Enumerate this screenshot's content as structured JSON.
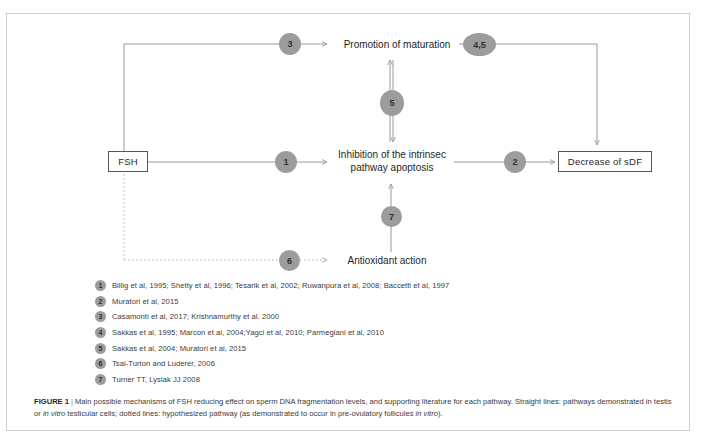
{
  "figure": {
    "caption_label": "FIGURE 1",
    "caption_separator": "|",
    "caption_part1": "Main possible mechanisms of FSH reducing effect on sperm DNA fragmentation levels, and supporting literature for each pathway. Straight lines: pathways demonstrated in testis or ",
    "caption_italic1": "in vitro",
    "caption_part2": " testicular cells; dotted lines: hypothesized pathway (as demonstrated to occur in pre-ovulatory follicules ",
    "caption_italic2": "in vitro",
    "caption_part3": ")."
  },
  "diagram": {
    "nodes": {
      "fsh": "FSH",
      "promotion": "Promotion of maturation",
      "inhibition_line1": "Inhibition of the intrinsec",
      "inhibition_line2": "pathway apoptosis",
      "antioxidant": "Antioxidant action",
      "decrease": "Decrease  of sDF"
    },
    "badges": [
      {
        "id": "badge-3",
        "label": "3"
      },
      {
        "id": "badge-45",
        "label": "4,5"
      },
      {
        "id": "badge-5",
        "label": "5"
      },
      {
        "id": "badge-1",
        "label": "1"
      },
      {
        "id": "badge-2",
        "label": "2"
      },
      {
        "id": "badge-7",
        "label": "7"
      },
      {
        "id": "badge-6",
        "label": "6"
      }
    ],
    "colors": {
      "badge_fill": "#9c9c9c",
      "line": "#9a9a9a",
      "box_border": "#555555",
      "frame": "#cfcfcf"
    }
  },
  "legend": {
    "items": [
      {
        "num": "1",
        "text": "Billig et al, 1995; Shetty et al, 1996; Tesarik et al, 2002; Ruwanpura et al, 2008; Baccetti et al, 1997"
      },
      {
        "num": "2",
        "text": "Muratori et al, 2015"
      },
      {
        "num": "3",
        "text": "Casamonti et al, 2017; Krishnamurthy et al. 2000"
      },
      {
        "num": "4",
        "text": "Sakkas et al, 1995; Marcon et al, 2004;Yagci et al, 2010; Parmegiani et al, 2010"
      },
      {
        "num": "5",
        "text": "Sakkas et al, 2004; Muratori et al, 2015"
      },
      {
        "num": "6",
        "text": "Tsai-Turton and Luderer, 2006"
      },
      {
        "num": "7",
        "text": "Turner TT, Lysiak JJ 2008"
      }
    ]
  }
}
